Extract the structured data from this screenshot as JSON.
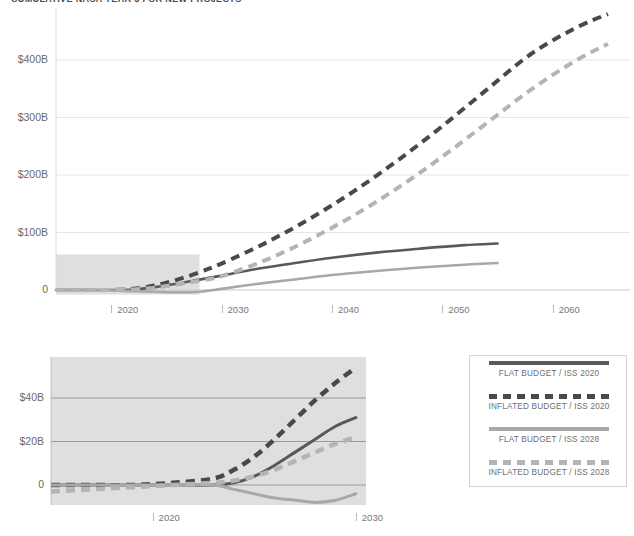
{
  "title": "CUMULATIVE NASA YEAR $ FOR NEW PROJECTS",
  "legend": {
    "items": [
      {
        "label": "FLAT BUDGET / ISS 2020",
        "style": "solid",
        "color": "#595959"
      },
      {
        "label": "INFLATED BUDGET / ISS 2020",
        "style": "dashed",
        "color": "#494949"
      },
      {
        "label": "FLAT BUDGET / ISS 2028",
        "style": "solid",
        "color": "#a8a8a8"
      },
      {
        "label": "INFLATED BUDGET / ISS 2028",
        "style": "dashed",
        "color": "#b4b4b4"
      }
    ]
  },
  "chart_data": [
    {
      "id": "overview",
      "type": "line",
      "title": "CUMULATIVE NASA YEAR $ FOR NEW PROJECTS",
      "xlabel": "",
      "ylabel": "",
      "xlim": [
        2015,
        2067
      ],
      "ylim": [
        -10,
        450
      ],
      "xticks": [
        2020,
        2030,
        2040,
        2050,
        2060
      ],
      "xticklabels": [
        "2020",
        "2030",
        "2040",
        "2050",
        "2060"
      ],
      "yticks": [
        0,
        100,
        200,
        300,
        400
      ],
      "yticklabels": [
        "0",
        "$100B",
        "$200B",
        "$300B",
        "$400B"
      ],
      "grid": true,
      "units": "billions of dollars",
      "highlight_region": {
        "x0": 2015,
        "x1": 2028,
        "y0": -8,
        "y1": 62,
        "color": "#d9d9d9"
      },
      "series": [
        {
          "name": "FLAT BUDGET / ISS 2020",
          "style": "solid",
          "color": "#595959",
          "x": [
            2015,
            2018,
            2020,
            2022,
            2024,
            2026,
            2028,
            2030,
            2033,
            2036,
            2040,
            2044,
            2048,
            2052,
            2055
          ],
          "y": [
            0,
            0,
            0,
            1,
            5,
            11,
            18,
            25,
            36,
            45,
            56,
            65,
            72,
            78,
            81
          ]
        },
        {
          "name": "INFLATED BUDGET / ISS 2020",
          "style": "dashed",
          "color": "#494949",
          "x": [
            2015,
            2018,
            2020,
            2022,
            2024,
            2026,
            2028,
            2030,
            2034,
            2038,
            2042,
            2046,
            2050,
            2054,
            2058,
            2062,
            2065
          ],
          "y": [
            0,
            0,
            0,
            2,
            8,
            18,
            31,
            46,
            82,
            124,
            172,
            226,
            285,
            348,
            410,
            455,
            480
          ]
        },
        {
          "name": "FLAT BUDGET / ISS 2028",
          "style": "solid",
          "color": "#a8a8a8",
          "x": [
            2015,
            2018,
            2020,
            2022,
            2024,
            2026,
            2028,
            2030,
            2033,
            2036,
            2040,
            2044,
            2048,
            2052,
            2055
          ],
          "y": [
            0,
            0,
            -1,
            -2,
            -3,
            -4,
            -3,
            2,
            10,
            17,
            26,
            33,
            39,
            44,
            47
          ]
        },
        {
          "name": "INFLATED BUDGET / ISS 2028",
          "style": "dashed",
          "color": "#b4b4b4",
          "x": [
            2015,
            2018,
            2020,
            2022,
            2024,
            2026,
            2028,
            2030,
            2034,
            2038,
            2042,
            2046,
            2050,
            2054,
            2058,
            2062,
            2065
          ],
          "y": [
            0,
            0,
            0,
            1,
            4,
            10,
            16,
            24,
            52,
            88,
            130,
            178,
            232,
            290,
            348,
            398,
            428
          ]
        }
      ]
    },
    {
      "id": "detail",
      "type": "line",
      "title": "",
      "xlabel": "",
      "ylabel": "",
      "xlim": [
        2015,
        2030.5
      ],
      "ylim": [
        -12,
        58
      ],
      "xticks": [
        2020,
        2030
      ],
      "xticklabels": [
        "2020",
        "2030"
      ],
      "yticks": [
        0,
        20,
        40
      ],
      "yticklabels": [
        "0",
        "$20B",
        "$40B"
      ],
      "grid": true,
      "units": "billions of dollars",
      "panel_background": "#d9d9d9",
      "series": [
        {
          "name": "FLAT BUDGET / ISS 2020",
          "style": "solid",
          "color": "#595959",
          "x": [
            2015,
            2017,
            2019,
            2021,
            2023,
            2024,
            2025,
            2026,
            2027,
            2028,
            2029,
            2030
          ],
          "y": [
            0,
            0,
            0,
            0,
            0,
            1,
            4,
            9,
            15,
            21,
            27,
            31
          ]
        },
        {
          "name": "INFLATED BUDGET / ISS 2020",
          "style": "dashed",
          "color": "#494949",
          "x": [
            2015,
            2017,
            2019,
            2021,
            2023,
            2024,
            2025,
            2026,
            2027,
            2028,
            2029,
            2030
          ],
          "y": [
            0,
            0,
            0,
            1,
            3,
            7,
            13,
            21,
            30,
            39,
            47,
            54
          ]
        },
        {
          "name": "FLAT BUDGET / ISS 2028",
          "style": "solid",
          "color": "#a8a8a8",
          "x": [
            2015,
            2017,
            2019,
            2021,
            2023,
            2024,
            2025,
            2026,
            2027,
            2028,
            2029,
            2030
          ],
          "y": [
            0,
            0,
            0,
            0,
            0,
            -2,
            -4,
            -6,
            -7,
            -8,
            -7,
            -4
          ]
        },
        {
          "name": "INFLATED BUDGET / ISS 2028",
          "style": "dashed",
          "color": "#b4b4b4",
          "x": [
            2015,
            2017,
            2019,
            2021,
            2023,
            2024,
            2025,
            2026,
            2027,
            2028,
            2029,
            2030
          ],
          "y": [
            -3,
            -2,
            -1,
            0,
            1,
            2,
            4,
            7,
            11,
            15,
            19,
            22
          ]
        }
      ]
    }
  ]
}
